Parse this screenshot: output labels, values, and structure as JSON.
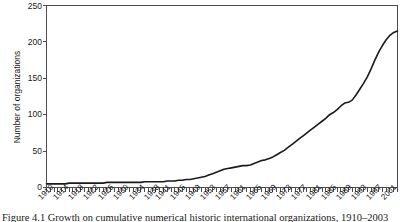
{
  "figure": {
    "caption": "Figure 4.1 Growth on cumulative numerical historic international organizations, 1910–2003"
  },
  "chart_data": {
    "type": "line",
    "title": "",
    "xlabel": "",
    "ylabel": "Number of organizations",
    "xlim": [
      1910,
      2003
    ],
    "ylim": [
      0,
      250
    ],
    "yticks": [
      0,
      50,
      100,
      150,
      200,
      250
    ],
    "xticklabels": [
      "1910",
      "1914",
      "1918",
      "1922",
      "1926",
      "1930",
      "1934",
      "1938",
      "1941",
      "1945",
      "1949",
      "1953",
      "1957",
      "1961",
      "1965",
      "1969",
      "1973",
      "1977",
      "1981",
      "1985",
      "1989",
      "1993",
      "1997",
      "2001"
    ],
    "grid": false,
    "legend": false,
    "line_color": "#1a1a1a",
    "x": [
      1910,
      1911,
      1912,
      1913,
      1914,
      1915,
      1916,
      1917,
      1918,
      1919,
      1920,
      1921,
      1922,
      1923,
      1924,
      1925,
      1926,
      1927,
      1928,
      1929,
      1930,
      1931,
      1932,
      1933,
      1934,
      1935,
      1936,
      1937,
      1938,
      1939,
      1940,
      1941,
      1942,
      1943,
      1944,
      1945,
      1946,
      1947,
      1948,
      1949,
      1950,
      1951,
      1952,
      1953,
      1954,
      1955,
      1956,
      1957,
      1958,
      1959,
      1960,
      1961,
      1962,
      1963,
      1964,
      1965,
      1966,
      1967,
      1968,
      1969,
      1970,
      1971,
      1972,
      1973,
      1974,
      1975,
      1976,
      1977,
      1978,
      1979,
      1980,
      1981,
      1982,
      1983,
      1984,
      1985,
      1986,
      1987,
      1988,
      1989,
      1990,
      1991,
      1992,
      1993,
      1994,
      1995,
      1996,
      1997,
      1998,
      1999,
      2000,
      2001,
      2002,
      2003
    ],
    "values": [
      5,
      5,
      5,
      5,
      5,
      5,
      6,
      6,
      6,
      6,
      6,
      6,
      6,
      6,
      6,
      6,
      7,
      7,
      7,
      7,
      7,
      7,
      7,
      7,
      7,
      7,
      8,
      8,
      8,
      8,
      8,
      8,
      9,
      9,
      9,
      10,
      10,
      11,
      11,
      12,
      13,
      14,
      15,
      17,
      19,
      21,
      23,
      25,
      26,
      27,
      28,
      29,
      30,
      30,
      31,
      33,
      35,
      37,
      38,
      40,
      42,
      45,
      48,
      51,
      55,
      59,
      63,
      67,
      71,
      75,
      79,
      83,
      87,
      91,
      95,
      100,
      103,
      107,
      112,
      116,
      117,
      120,
      127,
      135,
      143,
      152,
      163,
      175,
      186,
      195,
      203,
      209,
      213,
      215
    ]
  }
}
